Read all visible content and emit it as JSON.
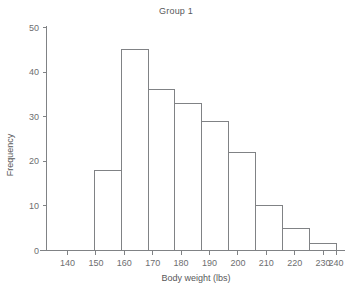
{
  "chart_data": {
    "type": "bar",
    "title": "Group 1",
    "xlabel": "Body weight (lbs)",
    "ylabel": "Frequency",
    "xlim": [
      135,
      246
    ],
    "ylim": [
      0,
      52
    ],
    "xticks": [
      140,
      150,
      160,
      170,
      180,
      190,
      200,
      210,
      220,
      230,
      240
    ],
    "yticks": [
      0,
      10,
      20,
      30,
      40,
      50
    ],
    "xtick_labels": [
      "140",
      "150",
      "160",
      "170",
      "180",
      "190",
      "200",
      "210",
      "220",
      "230",
      "240"
    ],
    "ytick_labels": [
      "0",
      "10",
      "20",
      "30",
      "40",
      "50"
    ],
    "grid": false,
    "legend": "none",
    "bin_width": 10,
    "bin_edges": [
      140,
      150,
      160,
      170,
      180,
      190,
      200,
      210,
      220,
      230,
      240
    ],
    "categories": [
      "140-150",
      "150-160",
      "160-170",
      "170-180",
      "180-190",
      "190-200",
      "200-210",
      "210-220",
      "220-230",
      "230-240"
    ],
    "values": [
      0,
      18,
      45,
      36,
      33,
      29,
      22,
      10,
      5,
      1.5
    ],
    "bar_fill_color": "#ffffff",
    "bar_edge_color": "#808285",
    "axis_color": "#808285",
    "text_color": "#58585a",
    "background_color": "#ffffff"
  }
}
